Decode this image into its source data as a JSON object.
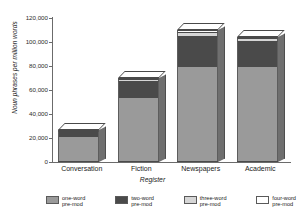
{
  "chart_data": {
    "type": "bar",
    "subtype": "stacked-bar-3d",
    "title": "",
    "xlabel": "Register",
    "ylabel": "Noun phrases per million words",
    "categories": [
      "Conversation",
      "Fiction",
      "Newspapers",
      "Academic"
    ],
    "series": [
      {
        "name": "one-word pre-mod",
        "color": "#9a9a9a",
        "values": [
          20500,
          53000,
          79500,
          79000
        ]
      },
      {
        "name": "two-word pre-mod",
        "color": "#4a4a4a",
        "values": [
          5200,
          14500,
          25500,
          22000
        ]
      },
      {
        "name": "three-word pre-mod",
        "color": "#d6d6d6",
        "values": [
          900,
          1800,
          3500,
          2000
        ]
      },
      {
        "name": "four-word pre-mod",
        "color": "#ffffff",
        "values": [
          300,
          700,
          1500,
          900
        ]
      }
    ],
    "totals": [
      26900,
      70000,
      110000,
      103900
    ],
    "ylim": [
      0,
      120000
    ],
    "ytick_values": [
      0,
      20000,
      40000,
      60000,
      80000,
      100000,
      120000
    ],
    "ytick_labels": [
      "0",
      "20,000",
      "40,000",
      "60,000",
      "80,000",
      "100,000",
      "120,000"
    ],
    "grid": false,
    "legend_position": "bottom"
  },
  "legend": {
    "items": [
      {
        "line1": "one-word",
        "line2": "pre-mod",
        "color": "#9a9a9a"
      },
      {
        "line1": "two-word",
        "line2": "pre-mod",
        "color": "#4a4a4a"
      },
      {
        "line1": "three-word",
        "line2": "pre-mod",
        "color": "#d6d6d6"
      },
      {
        "line1": "four-word",
        "line2": "pre-mod",
        "color": "#ffffff"
      }
    ]
  }
}
